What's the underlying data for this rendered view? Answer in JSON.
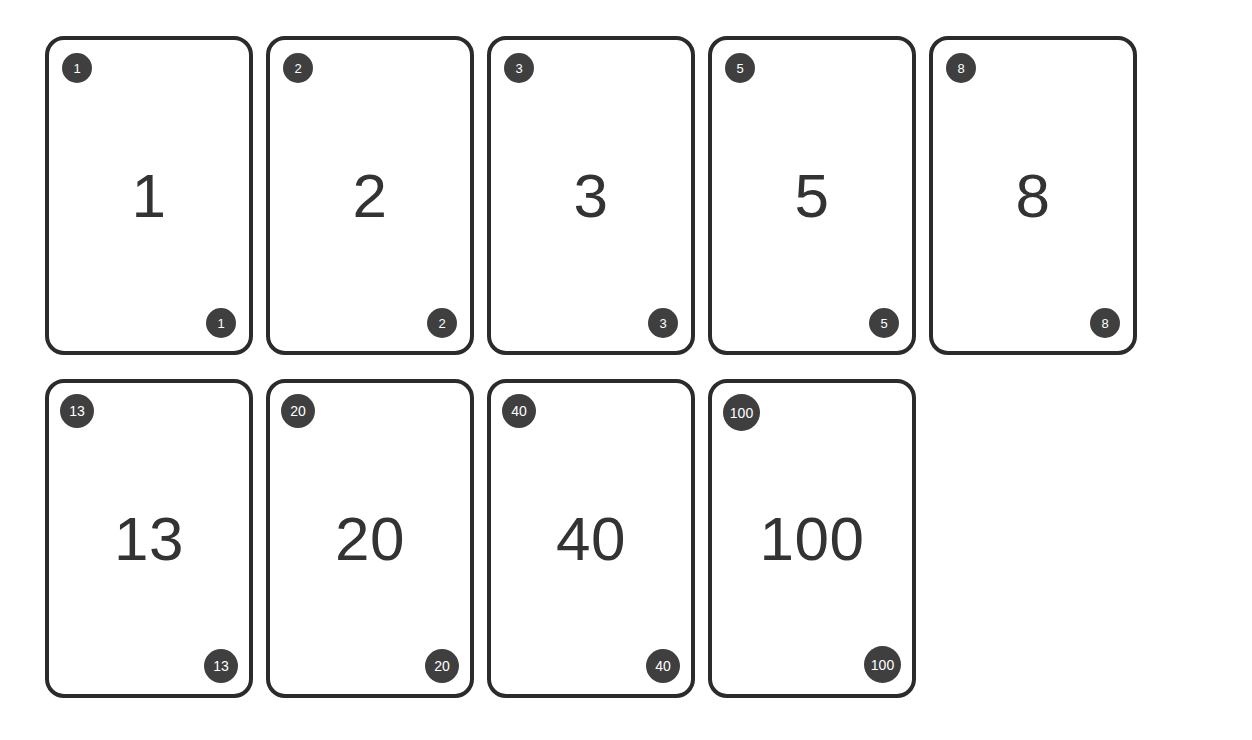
{
  "deck": {
    "name": "planning-poker-deck",
    "card_count": 9,
    "colors": {
      "background": "#ffffff",
      "card_fill": "#ffffff",
      "card_border": "#2b2b2b",
      "badge_fill": "#3f3f3f",
      "badge_text": "#ffffff",
      "value_text": "#333333"
    },
    "rows": [
      {
        "row_label": "row-1",
        "cards": [
          {
            "value": "1",
            "badge_top_left": "1",
            "badge_bottom_right": "1",
            "badge_size": "size-1"
          },
          {
            "value": "2",
            "badge_top_left": "2",
            "badge_bottom_right": "2",
            "badge_size": "size-1"
          },
          {
            "value": "3",
            "badge_top_left": "3",
            "badge_bottom_right": "3",
            "badge_size": "size-1"
          },
          {
            "value": "5",
            "badge_top_left": "5",
            "badge_bottom_right": "5",
            "badge_size": "size-1"
          },
          {
            "value": "8",
            "badge_top_left": "8",
            "badge_bottom_right": "8",
            "badge_size": "size-1"
          }
        ]
      },
      {
        "row_label": "row-2",
        "cards": [
          {
            "value": "13",
            "badge_top_left": "13",
            "badge_bottom_right": "13",
            "badge_size": "size-2"
          },
          {
            "value": "20",
            "badge_top_left": "20",
            "badge_bottom_right": "20",
            "badge_size": "size-2"
          },
          {
            "value": "40",
            "badge_top_left": "40",
            "badge_bottom_right": "40",
            "badge_size": "size-2"
          },
          {
            "value": "100",
            "badge_top_left": "100",
            "badge_bottom_right": "100",
            "badge_size": "size-3"
          }
        ]
      }
    ]
  }
}
